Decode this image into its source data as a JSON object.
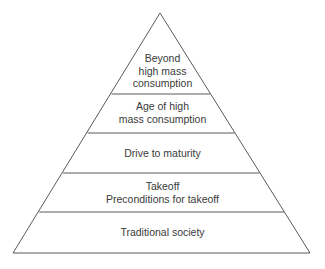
{
  "diagram": {
    "type": "pyramid",
    "stroke_color": "#5a5a5a",
    "levels": [
      {
        "lines": [
          "Beyond",
          "high mass",
          "consumption"
        ]
      },
      {
        "lines": [
          "Age of high",
          "mass consumption"
        ]
      },
      {
        "lines": [
          "Drive to maturity"
        ]
      },
      {
        "lines": [
          "Takeoff",
          "Preconditions for takeoff"
        ]
      },
      {
        "lines": [
          "Traditional society"
        ]
      }
    ]
  }
}
